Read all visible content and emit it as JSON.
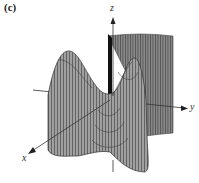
{
  "figure": {
    "panel_label": "(c)",
    "type": "3d-surface-wireframe"
  },
  "axes": {
    "x_label": "x",
    "y_label": "y",
    "z_label": "z"
  },
  "colors": {
    "surface_fill": "#9a9a9a",
    "surface_dark": "#5a5a5a",
    "mesh_line": "#3a3a3a",
    "axis": "#333333",
    "background": "#ffffff"
  }
}
